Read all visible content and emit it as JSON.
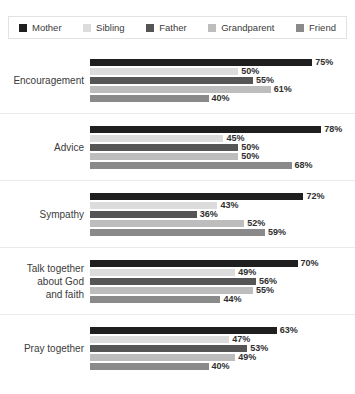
{
  "legend": {
    "items": [
      {
        "label": "Mother",
        "color": "#1f1f1f"
      },
      {
        "label": "Sibling",
        "color": "#dcdcdc"
      },
      {
        "label": "Father",
        "color": "#555555"
      },
      {
        "label": "Grandparent",
        "color": "#bdbdbd"
      },
      {
        "label": "Friend",
        "color": "#8a8a8a"
      }
    ]
  },
  "chart_data": {
    "type": "bar",
    "title": "",
    "xlabel": "",
    "ylabel": "",
    "xlim": [
      0,
      85
    ],
    "grid": false,
    "orientation": "horizontal",
    "legend_position": "top",
    "value_suffix": "%",
    "categories": [
      "Encouragement",
      "Advice",
      "Sympathy",
      "Talk together about God and faith",
      "Pray together"
    ],
    "series": [
      {
        "name": "Mother",
        "color": "#1f1f1f",
        "values": [
          75,
          78,
          72,
          70,
          63
        ]
      },
      {
        "name": "Sibling",
        "color": "#dcdcdc",
        "values": [
          50,
          45,
          43,
          49,
          47
        ]
      },
      {
        "name": "Father",
        "color": "#555555",
        "values": [
          55,
          50,
          36,
          56,
          53
        ]
      },
      {
        "name": "Grandparent",
        "color": "#bdbdbd",
        "values": [
          61,
          50,
          52,
          55,
          49
        ]
      },
      {
        "name": "Friend",
        "color": "#8a8a8a",
        "values": [
          40,
          68,
          59,
          44,
          40
        ]
      }
    ],
    "groups": [
      {
        "label_lines": [
          "Encouragement"
        ],
        "bars": [
          {
            "series": "Mother",
            "value": 75,
            "value_label": "75%",
            "color": "#1f1f1f"
          },
          {
            "series": "Sibling",
            "value": 50,
            "value_label": "50%",
            "color": "#dcdcdc"
          },
          {
            "series": "Father",
            "value": 55,
            "value_label": "55%",
            "color": "#555555"
          },
          {
            "series": "Grandparent",
            "value": 61,
            "value_label": "61%",
            "color": "#bdbdbd"
          },
          {
            "series": "Friend",
            "value": 40,
            "value_label": "40%",
            "color": "#8a8a8a"
          }
        ]
      },
      {
        "label_lines": [
          "Advice"
        ],
        "bars": [
          {
            "series": "Mother",
            "value": 78,
            "value_label": "78%",
            "color": "#1f1f1f"
          },
          {
            "series": "Sibling",
            "value": 45,
            "value_label": "45%",
            "color": "#dcdcdc"
          },
          {
            "series": "Father",
            "value": 50,
            "value_label": "50%",
            "color": "#555555"
          },
          {
            "series": "Grandparent",
            "value": 50,
            "value_label": "50%",
            "color": "#bdbdbd"
          },
          {
            "series": "Friend",
            "value": 68,
            "value_label": "68%",
            "color": "#8a8a8a"
          }
        ]
      },
      {
        "label_lines": [
          "Sympathy"
        ],
        "bars": [
          {
            "series": "Mother",
            "value": 72,
            "value_label": "72%",
            "color": "#1f1f1f"
          },
          {
            "series": "Sibling",
            "value": 43,
            "value_label": "43%",
            "color": "#dcdcdc"
          },
          {
            "series": "Father",
            "value": 36,
            "value_label": "36%",
            "color": "#555555"
          },
          {
            "series": "Grandparent",
            "value": 52,
            "value_label": "52%",
            "color": "#bdbdbd"
          },
          {
            "series": "Friend",
            "value": 59,
            "value_label": "59%",
            "color": "#8a8a8a"
          }
        ]
      },
      {
        "label_lines": [
          "Talk together",
          "about God",
          "and faith"
        ],
        "bars": [
          {
            "series": "Mother",
            "value": 70,
            "value_label": "70%",
            "color": "#1f1f1f"
          },
          {
            "series": "Sibling",
            "value": 49,
            "value_label": "49%",
            "color": "#dcdcdc"
          },
          {
            "series": "Father",
            "value": 56,
            "value_label": "56%",
            "color": "#555555"
          },
          {
            "series": "Grandparent",
            "value": 55,
            "value_label": "55%",
            "color": "#bdbdbd"
          },
          {
            "series": "Friend",
            "value": 44,
            "value_label": "44%",
            "color": "#8a8a8a"
          }
        ]
      },
      {
        "label_lines": [
          "Pray together"
        ],
        "bars": [
          {
            "series": "Mother",
            "value": 63,
            "value_label": "63%",
            "color": "#1f1f1f"
          },
          {
            "series": "Sibling",
            "value": 47,
            "value_label": "47%",
            "color": "#dcdcdc"
          },
          {
            "series": "Father",
            "value": 53,
            "value_label": "53%",
            "color": "#555555"
          },
          {
            "series": "Grandparent",
            "value": 49,
            "value_label": "49%",
            "color": "#bdbdbd"
          },
          {
            "series": "Friend",
            "value": 40,
            "value_label": "40%",
            "color": "#8a8a8a"
          }
        ]
      }
    ]
  }
}
